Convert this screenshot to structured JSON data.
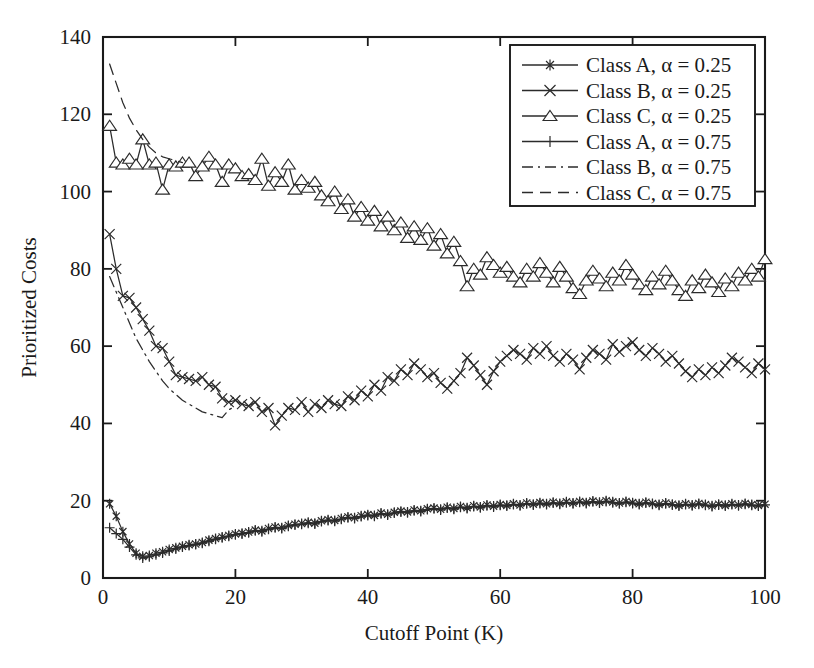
{
  "chart_data": {
    "type": "line",
    "title": "",
    "xlabel": "Cutoff Point (K)",
    "ylabel": "Prioritized Costs",
    "xlim": [
      0,
      100
    ],
    "ylim": [
      0,
      140
    ],
    "xticks": [
      0,
      20,
      40,
      60,
      80,
      100
    ],
    "yticks": [
      0,
      20,
      40,
      60,
      80,
      100,
      120,
      140
    ],
    "xtick_labels": [
      "0",
      "20",
      "40",
      "60",
      "80",
      "100"
    ],
    "ytick_labels": [
      "0",
      "20",
      "40",
      "60",
      "80",
      "100",
      "120",
      "140"
    ],
    "grid": false,
    "legend_position": "top-right",
    "series": [
      {
        "name": "Class A, α = 0.25",
        "marker": "asterisk",
        "linestyle": "solid",
        "color": "#2b2b2b",
        "x": [
          1,
          2,
          3,
          4,
          5,
          6,
          7,
          8,
          9,
          10,
          11,
          12,
          13,
          14,
          15,
          16,
          17,
          18,
          19,
          20,
          21,
          22,
          23,
          24,
          25,
          26,
          27,
          28,
          29,
          30,
          31,
          32,
          33,
          34,
          35,
          36,
          37,
          38,
          39,
          40,
          41,
          42,
          43,
          44,
          45,
          46,
          47,
          48,
          49,
          50,
          51,
          52,
          53,
          54,
          55,
          56,
          57,
          58,
          59,
          60,
          61,
          62,
          63,
          64,
          65,
          66,
          67,
          68,
          69,
          70,
          71,
          72,
          73,
          74,
          75,
          76,
          77,
          78,
          79,
          80,
          81,
          82,
          83,
          84,
          85,
          86,
          87,
          88,
          89,
          90,
          91,
          92,
          93,
          94,
          95,
          96,
          97,
          98,
          99,
          100
        ],
        "y": [
          19.2,
          16.0,
          12.0,
          8.8,
          6.4,
          5.6,
          5.8,
          6.4,
          6.8,
          7.4,
          7.8,
          8.2,
          8.6,
          8.8,
          9.2,
          9.8,
          10.2,
          10.6,
          11.0,
          11.4,
          11.6,
          11.9,
          12.4,
          12.2,
          12.8,
          13.2,
          13.0,
          13.6,
          13.9,
          14.1,
          14.4,
          14.2,
          14.8,
          15.1,
          14.9,
          15.4,
          15.8,
          15.6,
          16.1,
          16.4,
          16.2,
          16.8,
          16.5,
          17.0,
          17.3,
          17.1,
          17.6,
          17.4,
          17.9,
          18.1,
          17.8,
          18.3,
          18.0,
          18.5,
          18.2,
          18.7,
          18.4,
          18.9,
          18.6,
          19.0,
          18.8,
          19.2,
          18.9,
          19.4,
          19.1,
          19.5,
          19.2,
          19.6,
          19.3,
          19.7,
          19.4,
          19.8,
          19.5,
          19.9,
          19.6,
          20.0,
          19.7,
          19.4,
          19.8,
          19.5,
          19.2,
          19.6,
          19.3,
          19.0,
          19.4,
          19.1,
          18.8,
          19.2,
          18.9,
          19.3,
          19.0,
          18.7,
          19.1,
          18.8,
          19.2,
          18.9,
          19.3,
          19.0,
          18.8,
          19.1
        ]
      },
      {
        "name": "Class B, α = 0.25",
        "marker": "cross",
        "linestyle": "solid",
        "color": "#2b2b2b",
        "x": [
          1,
          2,
          3,
          4,
          5,
          6,
          7,
          8,
          9,
          10,
          11,
          12,
          13,
          14,
          15,
          16,
          17,
          18,
          19,
          20,
          21,
          22,
          23,
          24,
          25,
          26,
          27,
          28,
          29,
          30,
          31,
          32,
          33,
          34,
          35,
          36,
          37,
          38,
          39,
          40,
          41,
          42,
          43,
          44,
          45,
          46,
          47,
          48,
          49,
          50,
          51,
          52,
          53,
          54,
          55,
          56,
          57,
          58,
          59,
          60,
          61,
          62,
          63,
          64,
          65,
          66,
          67,
          68,
          69,
          70,
          71,
          72,
          73,
          74,
          75,
          76,
          77,
          78,
          79,
          80,
          81,
          82,
          83,
          84,
          85,
          86,
          87,
          88,
          89,
          90,
          91,
          92,
          93,
          94,
          95,
          96,
          97,
          98,
          99,
          100
        ],
        "y": [
          89.0,
          80.0,
          73.0,
          72.5,
          70.0,
          67.0,
          64.0,
          60.0,
          59.5,
          56.0,
          52.5,
          52.0,
          51.5,
          51.0,
          52.0,
          50.0,
          49.5,
          46.5,
          45.5,
          46.0,
          45.0,
          44.5,
          45.5,
          43.0,
          44.0,
          39.5,
          42.0,
          44.0,
          43.5,
          45.5,
          43.0,
          45.0,
          44.0,
          46.0,
          45.0,
          44.5,
          47.0,
          46.0,
          48.5,
          47.0,
          50.0,
          48.5,
          52.0,
          51.0,
          54.0,
          52.5,
          55.5,
          54.0,
          52.0,
          53.0,
          50.5,
          49.0,
          51.0,
          53.0,
          57.0,
          55.0,
          52.5,
          50.0,
          53.5,
          56.0,
          57.5,
          59.0,
          58.0,
          56.5,
          59.5,
          58.0,
          60.0,
          57.5,
          56.0,
          58.0,
          56.5,
          54.0,
          57.0,
          59.0,
          58.0,
          56.5,
          60.5,
          58.5,
          60.0,
          61.0,
          59.0,
          57.5,
          59.5,
          58.0,
          56.0,
          57.5,
          55.5,
          53.5,
          52.0,
          54.0,
          52.5,
          54.5,
          53.0,
          55.0,
          57.0,
          56.0,
          54.5,
          53.0,
          55.5,
          54.0
        ]
      },
      {
        "name": "Class C, α = 0.25",
        "marker": "triangle",
        "linestyle": "solid",
        "color": "#2b2b2b",
        "x": [
          1,
          2,
          3,
          4,
          5,
          6,
          7,
          8,
          9,
          10,
          11,
          12,
          13,
          14,
          15,
          16,
          17,
          18,
          19,
          20,
          21,
          22,
          23,
          24,
          25,
          26,
          27,
          28,
          29,
          30,
          31,
          32,
          33,
          34,
          35,
          36,
          37,
          38,
          39,
          40,
          41,
          42,
          43,
          44,
          45,
          46,
          47,
          48,
          49,
          50,
          51,
          52,
          53,
          54,
          55,
          56,
          57,
          58,
          59,
          60,
          61,
          62,
          63,
          64,
          65,
          66,
          67,
          68,
          69,
          70,
          71,
          72,
          73,
          74,
          75,
          76,
          77,
          78,
          79,
          80,
          81,
          82,
          83,
          84,
          85,
          86,
          87,
          88,
          89,
          90,
          91,
          92,
          93,
          94,
          95,
          96,
          97,
          98,
          99,
          100
        ],
        "y": [
          117.0,
          107.5,
          107.0,
          108.5,
          107.0,
          113.5,
          107.0,
          107.5,
          100.5,
          107.0,
          106.5,
          107.5,
          107.5,
          104.0,
          106.5,
          109.0,
          107.0,
          102.5,
          107.0,
          106.0,
          104.0,
          104.5,
          103.0,
          108.5,
          101.5,
          105.0,
          102.5,
          107.0,
          100.5,
          103.0,
          101.0,
          102.5,
          99.0,
          97.5,
          100.0,
          95.5,
          98.0,
          93.5,
          96.0,
          92.5,
          95.0,
          91.0,
          93.5,
          90.0,
          92.0,
          88.0,
          91.0,
          87.5,
          90.5,
          86.0,
          89.0,
          84.0,
          87.0,
          82.0,
          75.5,
          80.0,
          78.5,
          83.0,
          81.0,
          79.0,
          80.5,
          78.0,
          76.5,
          80.0,
          78.0,
          81.5,
          79.0,
          76.5,
          80.5,
          78.0,
          75.0,
          73.5,
          77.0,
          79.5,
          77.5,
          75.5,
          79.0,
          77.0,
          81.0,
          78.5,
          76.0,
          74.5,
          78.0,
          76.0,
          79.5,
          77.0,
          74.5,
          73.0,
          77.0,
          75.0,
          78.5,
          76.5,
          74.0,
          77.5,
          75.5,
          79.0,
          77.0,
          80.0,
          78.0,
          82.5
        ]
      },
      {
        "name": "Class A, α = 0.75",
        "marker": "plus",
        "linestyle": "solid",
        "color": "#2b2b2b",
        "x": [
          1,
          2,
          3,
          4,
          5,
          6,
          7,
          8,
          9,
          10,
          11,
          12,
          13,
          14,
          15,
          16,
          17,
          18,
          19,
          20,
          21,
          22,
          23,
          24,
          25,
          26,
          27,
          28,
          29,
          30,
          31,
          32,
          33,
          34,
          35,
          36,
          37,
          38,
          39,
          40,
          41,
          42,
          43,
          44,
          45,
          46,
          47,
          48,
          49,
          50,
          51,
          52,
          53,
          54,
          55,
          56,
          57,
          58,
          59,
          60,
          61,
          62,
          63,
          64,
          65,
          66,
          67,
          68,
          69,
          70,
          71,
          72,
          73,
          74,
          75,
          76,
          77,
          78,
          79,
          80,
          81,
          82,
          83,
          84,
          85,
          86,
          87,
          88,
          89,
          90,
          91,
          92,
          93,
          94,
          95,
          96,
          97,
          98,
          99,
          100
        ],
        "y": [
          13.0,
          11.5,
          10.0,
          8.0,
          6.0,
          5.2,
          5.5,
          6.0,
          6.5,
          7.0,
          7.5,
          8.0,
          8.4,
          8.7,
          9.0,
          9.5,
          10.0,
          10.4,
          10.8,
          11.2,
          11.4,
          11.7,
          12.2,
          12.0,
          12.6,
          13.0,
          12.8,
          13.4,
          13.7,
          13.9,
          14.2,
          14.0,
          14.6,
          14.9,
          14.7,
          15.2,
          15.6,
          15.4,
          15.9,
          16.2,
          16.0,
          16.6,
          16.3,
          16.8,
          17.1,
          16.9,
          17.4,
          17.2,
          17.7,
          17.9,
          17.6,
          18.1,
          17.8,
          18.3,
          18.0,
          18.5,
          18.2,
          18.7,
          18.4,
          18.8,
          18.6,
          19.0,
          18.7,
          19.2,
          18.9,
          19.3,
          19.0,
          19.4,
          19.1,
          19.5,
          19.2,
          19.6,
          19.3,
          19.7,
          19.4,
          19.8,
          19.5,
          19.2,
          19.6,
          19.3,
          19.0,
          19.4,
          19.1,
          18.8,
          19.2,
          18.9,
          18.6,
          19.0,
          18.7,
          19.1,
          18.8,
          18.5,
          18.9,
          18.6,
          19.0,
          18.7,
          19.1,
          18.8,
          18.6,
          18.9
        ]
      },
      {
        "name": "Class B, α = 0.75",
        "marker": "none",
        "linestyle": "dashdot",
        "color": "#2b2b2b",
        "x": [
          1,
          2,
          3,
          4,
          5,
          6,
          7,
          8,
          9,
          10,
          11,
          12,
          13,
          14,
          15,
          16,
          17,
          18,
          19,
          20
        ],
        "y": [
          78.0,
          74.0,
          70.0,
          66.0,
          62.0,
          59.0,
          56.0,
          53.5,
          51.0,
          49.0,
          47.5,
          46.0,
          45.0,
          44.0,
          43.0,
          42.5,
          42.0,
          41.5,
          43.5,
          44.5
        ]
      },
      {
        "name": "Class C, α = 0.75",
        "marker": "none",
        "linestyle": "dashed",
        "color": "#2b2b2b",
        "x": [
          1,
          2,
          3,
          4,
          5,
          6,
          7,
          8,
          9,
          10,
          11,
          12
        ],
        "y": [
          133.0,
          128.0,
          123.0,
          119.0,
          116.0,
          113.5,
          111.5,
          110.0,
          109.0,
          108.5,
          108.0,
          107.5
        ]
      }
    ],
    "legend_entries": [
      {
        "label": "Class A, α = 0.25",
        "marker": "asterisk",
        "linestyle": "solid"
      },
      {
        "label": "Class B, α = 0.25",
        "marker": "cross",
        "linestyle": "solid"
      },
      {
        "label": "Class C, α = 0.25",
        "marker": "triangle",
        "linestyle": "solid"
      },
      {
        "label": "Class A, α = 0.75",
        "marker": "plus",
        "linestyle": "solid"
      },
      {
        "label": "Class B, α = 0.75",
        "marker": "none",
        "linestyle": "dashdot"
      },
      {
        "label": "Class C, α = 0.75",
        "marker": "none",
        "linestyle": "dashed"
      }
    ],
    "colors": {
      "foreground": "#1a1a1a",
      "line": "#2b2b2b",
      "background": "#ffffff"
    }
  }
}
